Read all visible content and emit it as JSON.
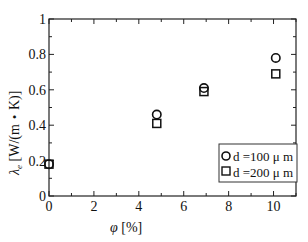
{
  "chart_data": {
    "type": "scatter",
    "title": "",
    "xlabel": "φ [%]",
    "ylabel": "λe [W/(m・K)]",
    "xlim": [
      0,
      11
    ],
    "ylim": [
      0,
      1
    ],
    "xticks": [
      0,
      2,
      4,
      6,
      8,
      10
    ],
    "yticks": [
      0,
      0.2,
      0.4,
      0.6,
      0.8,
      1
    ],
    "ytick_labels": [
      "0",
      "0.2",
      "0.4",
      "0.6",
      "0.8",
      "1"
    ],
    "grid": false,
    "legend_position": "lower right",
    "series": [
      {
        "name": "d=100 μm",
        "marker": "circle",
        "x": [
          0,
          4.8,
          6.9,
          10.1
        ],
        "y": [
          0.18,
          0.46,
          0.61,
          0.78
        ]
      },
      {
        "name": "d=200 μm",
        "marker": "square",
        "x": [
          0,
          4.8,
          6.9,
          10.1
        ],
        "y": [
          0.18,
          0.41,
          0.59,
          0.69
        ]
      }
    ]
  },
  "labels": {
    "xlabel_symbol": "φ",
    "xlabel_unit": " [%]",
    "ylabel_symbol": "λ",
    "ylabel_sub": "e",
    "ylabel_unit": " [W/(m・K)]",
    "legend_1": "d =100 μ m",
    "legend_2": "d =200 μ m"
  }
}
